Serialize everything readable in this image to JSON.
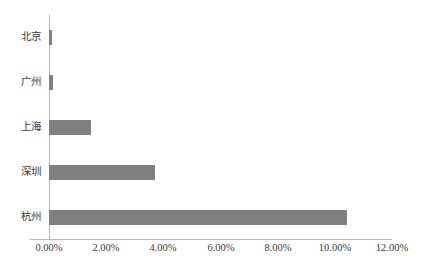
{
  "chart_data": {
    "type": "bar",
    "orientation": "horizontal",
    "title": "",
    "subtitle": "",
    "xlabel": "",
    "ylabel": "",
    "categories": [
      "北京",
      "广州",
      "上海",
      "深圳",
      "杭州"
    ],
    "values": [
      0.1,
      0.15,
      1.47,
      3.72,
      10.41
    ],
    "value_format": "percent",
    "xlim": [
      0,
      12
    ],
    "ylim": null,
    "xticks": [
      0,
      2,
      4,
      6,
      8,
      10,
      12
    ],
    "xtick_labels": [
      "0.00%",
      "2.00%",
      "4.00%",
      "6.00%",
      "8.00%",
      "10.00%",
      "12.00%"
    ],
    "ytick_labels": [
      "北京",
      "广州",
      "上海",
      "深圳",
      "杭州"
    ],
    "grid": false,
    "legend": null,
    "legend_position": "none",
    "series": [
      {
        "name": "",
        "values": [
          0.1,
          0.15,
          1.47,
          3.72,
          10.41
        ],
        "color": "#808080"
      }
    ],
    "annotations": []
  },
  "style": {
    "bar_color": "#808080",
    "axis_color": "#b9b9b9",
    "text_color": "#3a3a3a",
    "background": "#ffffff"
  }
}
